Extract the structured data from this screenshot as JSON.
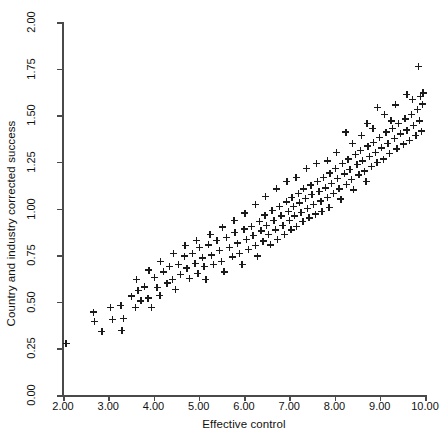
{
  "chart_data": {
    "type": "scatter",
    "title": "",
    "xlabel": "Effective control",
    "ylabel": "Country and industry corrected success",
    "xlim": [
      2.0,
      10.0
    ],
    "ylim": [
      0.0,
      2.0
    ],
    "xticks": [
      "2.00",
      "3.00",
      "4.00",
      "5.00",
      "6.00",
      "7.00",
      "8.00",
      "9.00",
      "10.00"
    ],
    "xtick_values": [
      2,
      3,
      4,
      5,
      6,
      7,
      8,
      9,
      10
    ],
    "yticks": [
      "0.00",
      "0.25",
      "0.50",
      "0.75",
      "1.00",
      "1.25",
      "1.50",
      "1.75",
      "2.00"
    ],
    "ytick_values": [
      0,
      0.25,
      0.5,
      0.75,
      1.0,
      1.25,
      1.5,
      1.75,
      2.0
    ],
    "grid": false,
    "legend": null,
    "marker": "plus",
    "marker_color": "#1a1a1a",
    "n_points": 176,
    "series": [
      {
        "name": "observations",
        "points": [
          [
            2.07,
            0.275
          ],
          [
            2.68,
            0.445
          ],
          [
            2.7,
            0.395
          ],
          [
            2.86,
            0.34
          ],
          [
            3.05,
            0.47
          ],
          [
            3.1,
            0.405
          ],
          [
            3.28,
            0.48
          ],
          [
            3.34,
            0.41
          ],
          [
            3.3,
            0.345
          ],
          [
            3.52,
            0.53
          ],
          [
            3.6,
            0.47
          ],
          [
            3.66,
            0.56
          ],
          [
            3.72,
            0.505
          ],
          [
            3.8,
            0.58
          ],
          [
            3.88,
            0.52
          ],
          [
            3.95,
            0.47
          ],
          [
            4.02,
            0.63
          ],
          [
            4.08,
            0.575
          ],
          [
            4.14,
            0.535
          ],
          [
            4.22,
            0.66
          ],
          [
            4.3,
            0.6
          ],
          [
            4.36,
            0.69
          ],
          [
            4.42,
            0.62
          ],
          [
            4.48,
            0.565
          ],
          [
            4.55,
            0.7
          ],
          [
            4.6,
            0.645
          ],
          [
            4.68,
            0.745
          ],
          [
            4.74,
            0.68
          ],
          [
            4.8,
            0.625
          ],
          [
            4.86,
            0.76
          ],
          [
            4.92,
            0.705
          ],
          [
            4.98,
            0.65
          ],
          [
            5.02,
            0.79
          ],
          [
            5.08,
            0.735
          ],
          [
            5.12,
            0.69
          ],
          [
            5.16,
            0.62
          ],
          [
            5.22,
            0.805
          ],
          [
            5.28,
            0.75
          ],
          [
            5.33,
            0.7
          ],
          [
            5.4,
            0.83
          ],
          [
            5.46,
            0.775
          ],
          [
            5.5,
            0.715
          ],
          [
            5.56,
            0.66
          ],
          [
            5.62,
            0.845
          ],
          [
            5.68,
            0.79
          ],
          [
            5.74,
            0.74
          ],
          [
            5.8,
            0.87
          ],
          [
            5.86,
            0.815
          ],
          [
            5.9,
            0.76
          ],
          [
            5.96,
            0.7
          ],
          [
            6.0,
            0.89
          ],
          [
            6.05,
            0.835
          ],
          [
            6.1,
            0.78
          ],
          [
            6.16,
            0.905
          ],
          [
            6.2,
            0.855
          ],
          [
            6.25,
            0.8
          ],
          [
            6.3,
            0.745
          ],
          [
            6.34,
            0.93
          ],
          [
            6.38,
            0.88
          ],
          [
            6.42,
            0.825
          ],
          [
            6.46,
            0.965
          ],
          [
            6.5,
            0.91
          ],
          [
            6.54,
            0.86
          ],
          [
            6.58,
            0.805
          ],
          [
            6.62,
            0.99
          ],
          [
            6.66,
            0.935
          ],
          [
            6.7,
            0.885
          ],
          [
            6.74,
            0.835
          ],
          [
            6.78,
            1.01
          ],
          [
            6.82,
            0.96
          ],
          [
            6.86,
            0.91
          ],
          [
            6.9,
            0.86
          ],
          [
            6.94,
            1.035
          ],
          [
            6.98,
            0.985
          ],
          [
            7.0,
            0.935
          ],
          [
            7.04,
            0.885
          ],
          [
            7.06,
            1.06
          ],
          [
            7.1,
            1.01
          ],
          [
            7.12,
            0.96
          ],
          [
            7.16,
            0.905
          ],
          [
            7.2,
            1.08
          ],
          [
            7.22,
            1.03
          ],
          [
            7.26,
            0.98
          ],
          [
            7.3,
            0.93
          ],
          [
            7.32,
            1.105
          ],
          [
            7.36,
            1.055
          ],
          [
            7.4,
            1.0
          ],
          [
            7.44,
            0.95
          ],
          [
            7.48,
            1.125
          ],
          [
            7.5,
            1.075
          ],
          [
            7.54,
            1.02
          ],
          [
            7.58,
            0.97
          ],
          [
            7.62,
            1.145
          ],
          [
            7.66,
            1.09
          ],
          [
            7.7,
            1.04
          ],
          [
            7.72,
            0.985
          ],
          [
            7.76,
            1.165
          ],
          [
            7.8,
            1.11
          ],
          [
            7.84,
            1.06
          ],
          [
            7.88,
            1.005
          ],
          [
            7.9,
            1.19
          ],
          [
            7.94,
            1.135
          ],
          [
            7.98,
            1.08
          ],
          [
            8.02,
            1.215
          ],
          [
            8.06,
            1.16
          ],
          [
            8.1,
            1.105
          ],
          [
            8.14,
            1.05
          ],
          [
            8.18,
            1.24
          ],
          [
            8.22,
            1.185
          ],
          [
            8.26,
            1.13
          ],
          [
            8.3,
            1.265
          ],
          [
            8.34,
            1.21
          ],
          [
            8.38,
            1.155
          ],
          [
            8.42,
            1.1
          ],
          [
            8.46,
            1.29
          ],
          [
            8.5,
            1.235
          ],
          [
            8.54,
            1.18
          ],
          [
            8.58,
            1.31
          ],
          [
            8.62,
            1.255
          ],
          [
            8.66,
            1.2
          ],
          [
            8.7,
            1.145
          ],
          [
            8.74,
            1.335
          ],
          [
            8.78,
            1.28
          ],
          [
            8.82,
            1.225
          ],
          [
            8.86,
            1.355
          ],
          [
            8.9,
            1.3
          ],
          [
            8.94,
            1.245
          ],
          [
            9.0,
            1.38
          ],
          [
            9.04,
            1.325
          ],
          [
            9.08,
            1.265
          ],
          [
            9.14,
            1.41
          ],
          [
            9.18,
            1.35
          ],
          [
            9.22,
            1.295
          ],
          [
            9.28,
            1.43
          ],
          [
            9.32,
            1.375
          ],
          [
            9.38,
            1.32
          ],
          [
            9.42,
            1.455
          ],
          [
            9.46,
            1.4
          ],
          [
            9.52,
            1.345
          ],
          [
            9.56,
            1.48
          ],
          [
            9.6,
            1.42
          ],
          [
            9.66,
            1.365
          ],
          [
            9.7,
            1.505
          ],
          [
            9.74,
            1.445
          ],
          [
            9.8,
            1.39
          ],
          [
            9.84,
            1.53
          ],
          [
            9.88,
            1.47
          ],
          [
            9.92,
            1.415
          ],
          [
            9.6,
            1.61
          ],
          [
            9.72,
            1.585
          ],
          [
            9.85,
            1.76
          ],
          [
            9.9,
            1.6
          ],
          [
            9.94,
            1.56
          ],
          [
            9.96,
            1.62
          ],
          [
            8.95,
            1.54
          ],
          [
            9.1,
            1.505
          ],
          [
            9.25,
            1.47
          ],
          [
            8.85,
            1.43
          ],
          [
            9.35,
            1.555
          ],
          [
            8.6,
            1.39
          ],
          [
            8.72,
            1.455
          ],
          [
            8.4,
            1.35
          ],
          [
            8.25,
            1.41
          ],
          [
            8.05,
            1.3
          ],
          [
            7.85,
            1.255
          ],
          [
            7.6,
            1.24
          ],
          [
            7.38,
            1.215
          ],
          [
            7.15,
            1.165
          ],
          [
            6.95,
            1.145
          ],
          [
            6.72,
            1.105
          ],
          [
            6.48,
            1.065
          ],
          [
            6.25,
            1.02
          ],
          [
            6.02,
            0.975
          ],
          [
            5.78,
            0.935
          ],
          [
            5.52,
            0.9
          ],
          [
            5.25,
            0.86
          ],
          [
            4.95,
            0.83
          ],
          [
            4.7,
            0.8
          ],
          [
            4.44,
            0.76
          ],
          [
            4.16,
            0.715
          ],
          [
            3.9,
            0.67
          ],
          [
            3.62,
            0.62
          ]
        ]
      }
    ]
  }
}
